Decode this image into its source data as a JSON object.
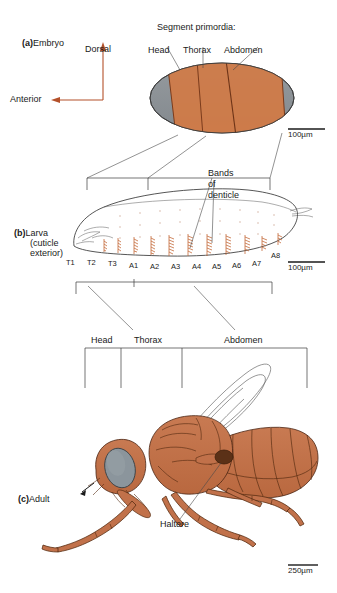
{
  "figure": {
    "panels": [
      {
        "id": "a",
        "tag": "(a)",
        "name": "Embryo"
      },
      {
        "id": "b",
        "tag": "(b)",
        "name": "Larva",
        "sub1": "(cuticle",
        "sub2": "exterior)"
      },
      {
        "id": "c",
        "tag": "(c)",
        "name": "Adult"
      }
    ]
  },
  "embryo": {
    "axes": {
      "dorsal": "Dorsal",
      "anterior": "Anterior"
    },
    "primordia_title": "Segment primordia:",
    "primordia": [
      "Head",
      "Thorax",
      "Abdomen"
    ],
    "scale": "100µm"
  },
  "larva": {
    "bands_label_lines": [
      "Bands",
      "of",
      "denticle"
    ],
    "segments": [
      "T1",
      "T2",
      "T3",
      "A1",
      "A2",
      "A3",
      "A4",
      "A5",
      "A6",
      "A7",
      "A8"
    ],
    "scale": "100µm"
  },
  "adult": {
    "regions": [
      "Head",
      "Thorax",
      "Abdomen"
    ],
    "haltere_label": "Haltere",
    "scale": "250µm"
  },
  "colors": {
    "segment_orange": "#cd7c4b",
    "embryo_gray": "#8b9196",
    "fly_body": "#c1714a",
    "fly_eye": "#8b959c",
    "axis_rust": "#b4512a",
    "denticle": "#c0622f",
    "line": "#3a3a3a",
    "background": "#ffffff"
  }
}
